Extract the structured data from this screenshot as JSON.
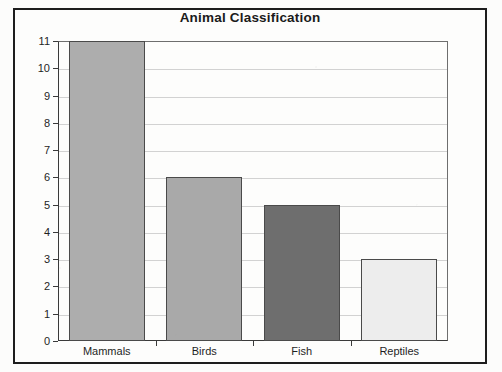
{
  "chart_data": {
    "type": "bar",
    "title": "Animal Classification",
    "xlabel": "",
    "ylabel": "",
    "categories": [
      "Mammals",
      "Birds",
      "Fish",
      "Reptiles"
    ],
    "values": [
      11,
      6,
      5,
      3
    ],
    "ylim": [
      0,
      11
    ],
    "ytick_labels": [
      "0",
      "1",
      "2",
      "3",
      "4",
      "5",
      "6",
      "7",
      "8",
      "9",
      "10",
      "11"
    ],
    "ytick_values": [
      0,
      1,
      2,
      3,
      4,
      5,
      6,
      7,
      8,
      9,
      10,
      11
    ],
    "grid": true,
    "legend": false,
    "bar_colors": [
      "#adadad",
      "#a9a9a9",
      "#6e6e6e",
      "#ededed"
    ],
    "bar_edge_color": "#4a4a4a",
    "gridline_color": "#d2d2d2",
    "axis_color": "#3a3a3a",
    "background_color": "#fdfdfc",
    "frame_color": "#1d1d1d"
  }
}
